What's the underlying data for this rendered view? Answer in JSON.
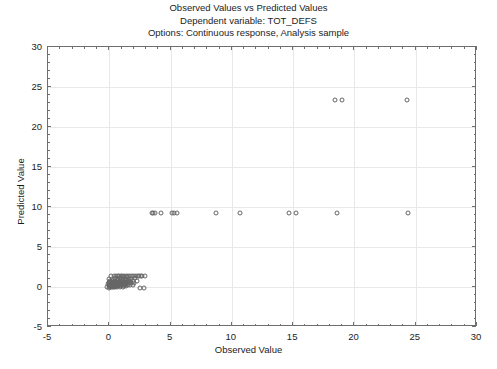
{
  "title": {
    "line1": "Observed Values vs Predicted Values",
    "line2": "Dependent variable: TOT_DEFS",
    "line3": "Options: Continuous response, Analysis sample"
  },
  "colors": {
    "background": "#ffffff",
    "frame": "#6e6e6e",
    "gridline": "#e8e8e8",
    "marker_outline": "#666666",
    "text": "#1c1c1c"
  },
  "chart_data": {
    "type": "scatter",
    "title": "Observed Values vs Predicted Values",
    "subtitle": "Dependent variable: TOT_DEFS",
    "annotation": "Options: Continuous response, Analysis sample",
    "xlabel": "Observed Value",
    "ylabel": "Predicted Value",
    "xlim": [
      -5,
      30
    ],
    "ylim": [
      -5,
      30
    ],
    "xticks": [
      -5,
      0,
      5,
      10,
      15,
      20,
      25,
      30
    ],
    "yticks": [
      -5,
      0,
      5,
      10,
      15,
      20,
      25,
      30
    ],
    "minor_tick_step": 1,
    "grid": true,
    "legend": null,
    "marker": "open-circle",
    "series": [
      {
        "name": "observations",
        "points": [
          [
            -0.15,
            0.05
          ],
          [
            -0.1,
            0.35
          ],
          [
            -0.05,
            0.1
          ],
          [
            -0.05,
            0.6
          ],
          [
            0.0,
            -0.1
          ],
          [
            0.0,
            0.2
          ],
          [
            0.0,
            0.5
          ],
          [
            0.0,
            0.95
          ],
          [
            0.05,
            0.0
          ],
          [
            0.05,
            0.3
          ],
          [
            0.05,
            0.75
          ],
          [
            0.1,
            0.15
          ],
          [
            0.1,
            0.45
          ],
          [
            0.1,
            1.35
          ],
          [
            0.15,
            -0.05
          ],
          [
            0.15,
            0.25
          ],
          [
            0.15,
            0.6
          ],
          [
            0.2,
            0.05
          ],
          [
            0.2,
            0.4
          ],
          [
            0.2,
            0.9
          ],
          [
            0.25,
            0.15
          ],
          [
            0.25,
            0.55
          ],
          [
            0.3,
            -0.05
          ],
          [
            0.3,
            0.3
          ],
          [
            0.3,
            0.7
          ],
          [
            0.35,
            0.1
          ],
          [
            0.35,
            0.45
          ],
          [
            0.35,
            1.35
          ],
          [
            0.4,
            0.0
          ],
          [
            0.4,
            0.25
          ],
          [
            0.4,
            0.65
          ],
          [
            0.45,
            0.15
          ],
          [
            0.45,
            0.5
          ],
          [
            0.45,
            1.1
          ],
          [
            0.5,
            0.05
          ],
          [
            0.5,
            0.35
          ],
          [
            0.5,
            0.8
          ],
          [
            0.55,
            0.2
          ],
          [
            0.55,
            0.6
          ],
          [
            0.55,
            1.35
          ],
          [
            0.6,
            0.1
          ],
          [
            0.6,
            0.45
          ],
          [
            0.6,
            1.0
          ],
          [
            0.65,
            0.0
          ],
          [
            0.65,
            0.3
          ],
          [
            0.65,
            0.7
          ],
          [
            0.7,
            0.2
          ],
          [
            0.7,
            0.55
          ],
          [
            0.7,
            1.35
          ],
          [
            0.75,
            0.1
          ],
          [
            0.75,
            0.4
          ],
          [
            0.75,
            0.9
          ],
          [
            0.8,
            0.25
          ],
          [
            0.8,
            0.65
          ],
          [
            0.8,
            1.35
          ],
          [
            0.85,
            0.05
          ],
          [
            0.85,
            0.5
          ],
          [
            0.85,
            1.15
          ],
          [
            0.9,
            0.3
          ],
          [
            0.9,
            0.75
          ],
          [
            0.95,
            0.15
          ],
          [
            0.95,
            0.55
          ],
          [
            0.95,
            1.35
          ],
          [
            1.0,
            0.4
          ],
          [
            1.0,
            0.95
          ],
          [
            1.05,
            0.2
          ],
          [
            1.05,
            0.7
          ],
          [
            1.05,
            1.35
          ],
          [
            1.1,
            0.05
          ],
          [
            1.1,
            0.5
          ],
          [
            1.1,
            1.2
          ],
          [
            1.15,
            0.35
          ],
          [
            1.15,
            0.85
          ],
          [
            1.2,
            0.15
          ],
          [
            1.2,
            0.6
          ],
          [
            1.2,
            1.4
          ],
          [
            1.25,
            0.45
          ],
          [
            1.25,
            1.0
          ],
          [
            1.3,
            0.25
          ],
          [
            1.3,
            0.75
          ],
          [
            1.35,
            0.1
          ],
          [
            1.35,
            0.55
          ],
          [
            1.35,
            1.4
          ],
          [
            1.4,
            0.35
          ],
          [
            1.4,
            0.9
          ],
          [
            1.45,
            0.6
          ],
          [
            1.45,
            1.25
          ],
          [
            1.5,
            0.2
          ],
          [
            1.5,
            0.8
          ],
          [
            1.5,
            1.4
          ],
          [
            1.6,
            0.45
          ],
          [
            1.6,
            1.05
          ],
          [
            1.65,
            0.7
          ],
          [
            1.7,
            0.3
          ],
          [
            1.7,
            1.4
          ],
          [
            1.75,
            0.95
          ],
          [
            1.8,
            0.55
          ],
          [
            1.85,
            1.35
          ],
          [
            1.9,
            0.2
          ],
          [
            1.95,
            0.8
          ],
          [
            2.0,
            1.4
          ],
          [
            2.05,
            0.45
          ],
          [
            2.1,
            1.1
          ],
          [
            2.2,
            1.4
          ],
          [
            2.25,
            0.7
          ],
          [
            2.35,
            1.35
          ],
          [
            2.45,
            1.4
          ],
          [
            2.5,
            -0.1
          ],
          [
            2.6,
            1.4
          ],
          [
            2.7,
            1.35
          ],
          [
            2.8,
            -0.1
          ],
          [
            2.9,
            1.4
          ],
          [
            3.45,
            9.2
          ],
          [
            3.6,
            9.2
          ],
          [
            3.75,
            9.2
          ],
          [
            4.2,
            9.2
          ],
          [
            5.1,
            9.2
          ],
          [
            5.3,
            9.2
          ],
          [
            5.5,
            9.2
          ],
          [
            8.7,
            9.2
          ],
          [
            10.7,
            9.2
          ],
          [
            14.7,
            9.2
          ],
          [
            15.2,
            9.2
          ],
          [
            18.6,
            9.2
          ],
          [
            24.4,
            9.2
          ],
          [
            18.4,
            23.35
          ],
          [
            19.0,
            23.35
          ],
          [
            24.3,
            23.35
          ]
        ]
      }
    ]
  }
}
